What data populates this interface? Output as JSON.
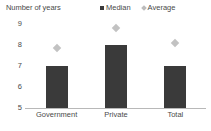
{
  "chart_data": {
    "type": "bar",
    "title": "",
    "ylabel": "Number of years",
    "xlabel": "",
    "categories": [
      "Government",
      "Private",
      "Total"
    ],
    "series": [
      {
        "name": "Median",
        "type": "bar",
        "color": "#3a3a3a",
        "values": [
          7,
          8,
          7
        ]
      },
      {
        "name": "Average",
        "type": "scatter",
        "marker": "diamond",
        "color": "#c2c2c2",
        "values": [
          7.85,
          8.8,
          8.1
        ]
      }
    ],
    "ylim": [
      5,
      9
    ],
    "yticks": [
      5,
      6,
      7,
      8,
      9
    ],
    "ytick_labels": [
      "5",
      "6",
      "7",
      "8",
      "9"
    ],
    "grid": false,
    "legend_position": "top-right"
  },
  "legend": {
    "entries": [
      {
        "label": "Median",
        "marker": "square-marker-icon"
      },
      {
        "label": "Average",
        "marker": "diamond-marker-icon"
      }
    ]
  }
}
